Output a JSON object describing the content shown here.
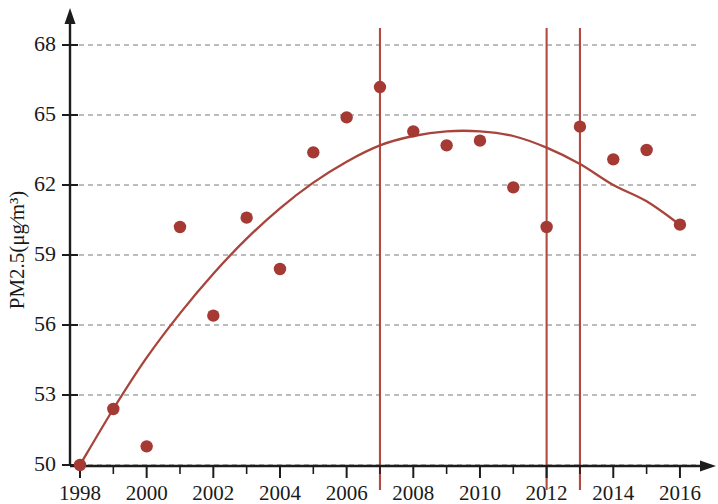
{
  "chart_data": {
    "type": "scatter",
    "title": "",
    "subtitle": "",
    "xlabel": "",
    "ylabel": "PM2.5(μg∕m³)",
    "xlim": [
      1998,
      2016.6
    ],
    "ylim": [
      50,
      69.2
    ],
    "grid": true,
    "legend": "none",
    "x": [
      1998,
      1999,
      2000,
      2001,
      2002,
      2003,
      2004,
      2005,
      2006,
      2007,
      2008,
      2009,
      2010,
      2011,
      2012,
      2013,
      2014,
      2015,
      2016
    ],
    "values": [
      50.0,
      52.4,
      50.8,
      60.2,
      56.4,
      60.6,
      58.4,
      63.4,
      64.9,
      66.2,
      64.3,
      63.7,
      63.9,
      61.9,
      60.2,
      64.5,
      63.1,
      63.5,
      60.3
    ],
    "series": [
      {
        "name": "PM2.5 annual mean",
        "marker": "circle",
        "color": "#a43a33",
        "values": [
          50.0,
          52.4,
          50.8,
          60.2,
          56.4,
          60.6,
          58.4,
          63.4,
          64.9,
          66.2,
          64.3,
          63.7,
          63.9,
          61.9,
          60.2,
          64.5,
          63.1,
          63.5,
          60.3
        ]
      }
    ],
    "trend_curve": {
      "name": "fitted quadratic trend",
      "color": "#a8443c",
      "x": [
        1998,
        1999,
        2000,
        2001,
        2002,
        2003,
        2004,
        2005,
        2006,
        2007,
        2008,
        2009,
        2010,
        2011,
        2012,
        2013,
        2014,
        2015,
        2016
      ],
      "y": [
        50.0,
        52.4,
        54.6,
        56.5,
        58.2,
        59.7,
        61.0,
        62.1,
        63.0,
        63.7,
        64.1,
        64.3,
        64.3,
        64.1,
        63.6,
        62.9,
        62.0,
        61.3,
        60.3
      ]
    },
    "vertical_lines": [
      {
        "x": 2007,
        "color": "#b24a42"
      },
      {
        "x": 2012,
        "color": "#b24a42"
      },
      {
        "x": 2013,
        "color": "#b24a42"
      }
    ],
    "y_ticks": [
      50,
      53,
      56,
      59,
      62,
      65,
      68
    ],
    "y_tick_labels": [
      "50",
      "53",
      "56",
      "59",
      "62",
      "65",
      "68"
    ],
    "x_ticks": [
      1998,
      2000,
      2002,
      2004,
      2006,
      2008,
      2010,
      2012,
      2014,
      2016
    ],
    "x_tick_labels": [
      "1998",
      "2000",
      "2002",
      "2004",
      "2006",
      "2008",
      "2010",
      "2012",
      "2014",
      "2016"
    ],
    "x_minor_ticks": [
      1999,
      2001,
      2003,
      2005,
      2007,
      2009,
      2011,
      2013,
      2015
    ],
    "colors": {
      "point": "#a43a33",
      "curve": "#a8443c",
      "vline": "#b24a42",
      "grid": "#7a7a7a",
      "axis": "#1c1c1c",
      "text": "#1a1a1a",
      "background": "#ffffff"
    }
  }
}
